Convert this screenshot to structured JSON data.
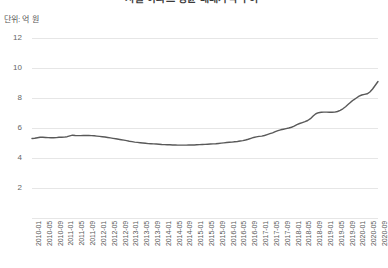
{
  "chart_data": {
    "type": "line",
    "title": "서울 아파트 평균 매매가격 추이",
    "subtitle": "",
    "unit_label": "단위: 억 원",
    "xlabel": "",
    "ylabel": "",
    "ylim": [
      0,
      12
    ],
    "yticks": [
      12,
      10,
      8,
      6,
      4,
      2
    ],
    "grid": true,
    "legend": "none",
    "line_color": "#595959",
    "grid_color": "#e6e6e6",
    "tick_color": "#666666",
    "x_tick_labels": [
      "2010-01",
      "2010-05",
      "2010-09",
      "2011-01",
      "2011-05",
      "2011-09",
      "2012-01",
      "2012-05",
      "2012-09",
      "2013-01",
      "2013-05",
      "2013-09",
      "2014-01",
      "2014-05",
      "2014-09",
      "2015-01",
      "2015-05",
      "2015-09",
      "2016-01",
      "2016-05",
      "2016-09",
      "2017-01",
      "2017-05",
      "2017-09",
      "2018-01",
      "2018-05",
      "2018-09",
      "2019-01",
      "2019-05",
      "2019-09",
      "2020-01",
      "2020-05",
      "2020-09"
    ],
    "x": [
      "2010-01",
      "2010-02",
      "2010-03",
      "2010-04",
      "2010-05",
      "2010-06",
      "2010-07",
      "2010-08",
      "2010-09",
      "2010-10",
      "2010-11",
      "2010-12",
      "2011-01",
      "2011-02",
      "2011-03",
      "2011-04",
      "2011-05",
      "2011-06",
      "2011-07",
      "2011-08",
      "2011-09",
      "2011-10",
      "2011-11",
      "2011-12",
      "2012-01",
      "2012-02",
      "2012-03",
      "2012-04",
      "2012-05",
      "2012-06",
      "2012-07",
      "2012-08",
      "2012-09",
      "2012-10",
      "2012-11",
      "2012-12",
      "2013-01",
      "2013-02",
      "2013-03",
      "2013-04",
      "2013-05",
      "2013-06",
      "2013-07",
      "2013-08",
      "2013-09",
      "2013-10",
      "2013-11",
      "2013-12",
      "2014-01",
      "2014-02",
      "2014-03",
      "2014-04",
      "2014-05",
      "2014-06",
      "2014-07",
      "2014-08",
      "2014-09",
      "2014-10",
      "2014-11",
      "2014-12",
      "2015-01",
      "2015-02",
      "2015-03",
      "2015-04",
      "2015-05",
      "2015-06",
      "2015-07",
      "2015-08",
      "2015-09",
      "2015-10",
      "2015-11",
      "2015-12",
      "2016-01",
      "2016-02",
      "2016-03",
      "2016-04",
      "2016-05",
      "2016-06",
      "2016-07",
      "2016-08",
      "2016-09",
      "2016-10",
      "2016-11",
      "2016-12",
      "2017-01",
      "2017-02",
      "2017-03",
      "2017-04",
      "2017-05",
      "2017-06",
      "2017-07",
      "2017-08",
      "2017-09",
      "2017-10",
      "2017-11",
      "2017-12",
      "2018-01",
      "2018-02",
      "2018-03",
      "2018-04",
      "2018-05",
      "2018-06",
      "2018-07",
      "2018-08",
      "2018-09",
      "2018-10",
      "2018-11",
      "2018-12",
      "2019-01",
      "2019-02",
      "2019-03",
      "2019-04",
      "2019-05",
      "2019-06",
      "2019-07",
      "2019-08",
      "2019-09",
      "2019-10",
      "2019-11",
      "2019-12",
      "2020-01",
      "2020-02",
      "2020-03",
      "2020-04",
      "2020-05",
      "2020-06",
      "2020-07",
      "2020-08",
      "2020-09"
    ],
    "values": [
      5.3,
      5.32,
      5.35,
      5.38,
      5.38,
      5.37,
      5.36,
      5.35,
      5.35,
      5.36,
      5.38,
      5.38,
      5.39,
      5.42,
      5.47,
      5.52,
      5.5,
      5.49,
      5.49,
      5.5,
      5.5,
      5.5,
      5.49,
      5.48,
      5.46,
      5.44,
      5.42,
      5.4,
      5.37,
      5.34,
      5.31,
      5.28,
      5.25,
      5.22,
      5.19,
      5.16,
      5.12,
      5.09,
      5.06,
      5.04,
      5.02,
      5.0,
      4.98,
      4.96,
      4.95,
      4.94,
      4.93,
      4.92,
      4.9,
      4.89,
      4.88,
      4.88,
      4.87,
      4.87,
      4.86,
      4.86,
      4.86,
      4.86,
      4.87,
      4.87,
      4.87,
      4.88,
      4.89,
      4.9,
      4.91,
      4.92,
      4.93,
      4.94,
      4.95,
      4.97,
      4.99,
      5.01,
      5.03,
      5.05,
      5.06,
      5.08,
      5.1,
      5.13,
      5.16,
      5.2,
      5.25,
      5.31,
      5.37,
      5.41,
      5.44,
      5.46,
      5.5,
      5.56,
      5.62,
      5.68,
      5.76,
      5.83,
      5.88,
      5.92,
      5.96,
      6.0,
      6.05,
      6.12,
      6.22,
      6.3,
      6.36,
      6.42,
      6.5,
      6.62,
      6.8,
      6.95,
      7.02,
      7.05,
      7.06,
      7.06,
      7.05,
      7.05,
      7.06,
      7.1,
      7.18,
      7.28,
      7.42,
      7.58,
      7.74,
      7.88,
      8.0,
      8.12,
      8.2,
      8.24,
      8.28,
      8.4,
      8.6,
      8.85,
      9.1
    ]
  }
}
